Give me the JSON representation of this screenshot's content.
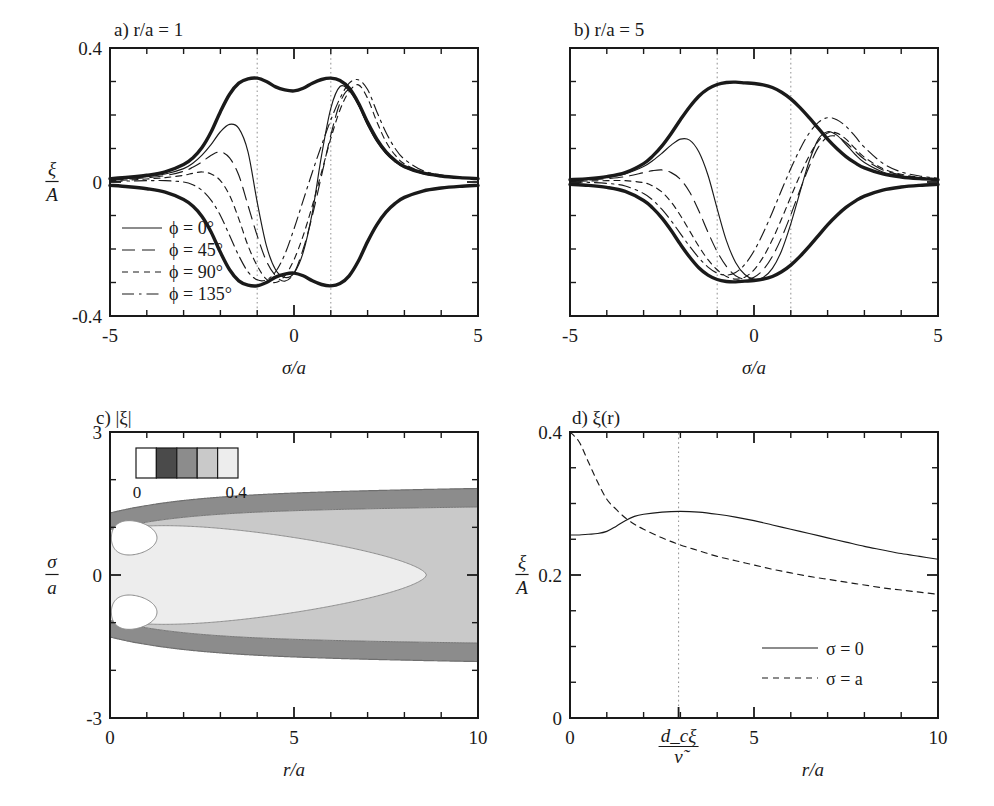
{
  "figure": {
    "background": "#ffffff",
    "ink": "#1a1a1a",
    "guide_color": "#9a9a9a"
  },
  "panels": {
    "a": {
      "title": "a) r/a = 1",
      "letter": "a)",
      "condition": "r/a = 1",
      "xlabel": "σ/a",
      "ylabel_num": "ξ",
      "ylabel_den": "A",
      "xticks": [
        "-5",
        "0",
        "5"
      ],
      "yticks": [
        "0.4",
        "0",
        "-0.4"
      ],
      "xlim": [
        -5,
        5
      ],
      "ylim": [
        -0.4,
        0.4
      ],
      "guides": [
        "-1",
        "1"
      ],
      "legend": [
        {
          "label": "ϕ = 0°",
          "style": "solid"
        },
        {
          "label": "ϕ = 45°",
          "style": "longdash"
        },
        {
          "label": "ϕ = 90°",
          "style": "shortdash"
        },
        {
          "label": "ϕ = 135°",
          "style": "dashdot"
        }
      ]
    },
    "b": {
      "title": "b) r/a = 5",
      "letter": "b)",
      "condition": "r/a = 5",
      "xlabel": "σ/a",
      "xticks": [
        "-5",
        "0",
        "5"
      ],
      "yticks": [
        "",
        "",
        ""
      ],
      "xlim": [
        -5,
        5
      ],
      "ylim": [
        -0.4,
        0.4
      ],
      "guides": [
        "-1",
        "1"
      ]
    },
    "c": {
      "title": "c) |ξ|",
      "letter": "c)",
      "quantity": "|ξ|",
      "xlabel": "r/a",
      "ylabel_num": "σ",
      "ylabel_den": "a",
      "xticks": [
        "0",
        "5",
        "10"
      ],
      "yticks": [
        "3",
        "0",
        "-3"
      ],
      "xlim": [
        0,
        10
      ],
      "ylim": [
        -3,
        3
      ],
      "colorbar": {
        "min_label": "0",
        "max_label": "0.4",
        "swatches": [
          "#ffffff",
          "#4a4a4a",
          "#8c8c8c",
          "#c9c9c9",
          "#ededed"
        ]
      }
    },
    "d": {
      "title": "d) ξ(r)",
      "letter": "d)",
      "quantity": "ξ(r)",
      "xlabel": "r/a",
      "ylabel_num": "ξ",
      "ylabel_den": "A",
      "xticks": [
        "0",
        "5",
        "10"
      ],
      "yticks": [
        "0.4",
        "0.2",
        "0"
      ],
      "xlim": [
        0,
        10
      ],
      "ylim": [
        0,
        0.4
      ],
      "special_tick": {
        "num": "d_cξ",
        "den": "ν̃",
        "x": 2.95
      },
      "legend": [
        {
          "label": "σ = 0",
          "style": "solid"
        },
        {
          "label": "σ = a",
          "style": "shortdash"
        }
      ]
    }
  },
  "chart_data": [
    {
      "id": "panel-a",
      "type": "line",
      "title": "a) r/a = 1",
      "xlabel": "sigma/a",
      "ylabel": "xi/A",
      "xlim": [
        -5,
        5
      ],
      "ylim": [
        -0.4,
        0.4
      ],
      "grid": false,
      "vertical_guides": [
        -1,
        1
      ],
      "legend_position": "lower-left",
      "x": [
        -5,
        -4.5,
        -4,
        -3.5,
        -3,
        -2.75,
        -2.5,
        -2.25,
        -2,
        -1.75,
        -1.5,
        -1.25,
        -1,
        -0.75,
        -0.5,
        -0.25,
        0,
        0.25,
        0.5,
        0.75,
        1,
        1.25,
        1.5,
        1.75,
        2,
        2.25,
        2.5,
        2.75,
        3,
        3.5,
        4,
        4.5,
        5
      ],
      "series": [
        {
          "name": "envelope upper",
          "style": "thick-solid",
          "values": [
            0.01,
            0.014,
            0.02,
            0.03,
            0.052,
            0.072,
            0.103,
            0.15,
            0.21,
            0.262,
            0.295,
            0.308,
            0.31,
            0.3,
            0.284,
            0.275,
            0.272,
            0.28,
            0.295,
            0.306,
            0.31,
            0.303,
            0.28,
            0.236,
            0.178,
            0.128,
            0.09,
            0.064,
            0.046,
            0.027,
            0.018,
            0.013,
            0.01
          ]
        },
        {
          "name": "envelope lower",
          "style": "thick-solid",
          "values": [
            -0.01,
            -0.014,
            -0.02,
            -0.03,
            -0.052,
            -0.072,
            -0.103,
            -0.15,
            -0.21,
            -0.262,
            -0.295,
            -0.308,
            -0.31,
            -0.3,
            -0.284,
            -0.275,
            -0.272,
            -0.28,
            -0.295,
            -0.306,
            -0.31,
            -0.303,
            -0.28,
            -0.236,
            -0.178,
            -0.128,
            -0.09,
            -0.064,
            -0.046,
            -0.027,
            -0.018,
            -0.013,
            -0.01
          ]
        },
        {
          "name": "phi = 0 deg",
          "style": "solid",
          "values": [
            0.008,
            0.011,
            0.016,
            0.024,
            0.04,
            0.056,
            0.08,
            0.112,
            0.15,
            0.172,
            0.16,
            0.09,
            -0.06,
            -0.19,
            -0.262,
            -0.285,
            -0.272,
            -0.21,
            -0.09,
            0.08,
            0.22,
            0.285,
            0.272,
            0.23,
            0.17,
            0.12,
            0.085,
            0.06,
            0.043,
            0.025,
            0.017,
            0.012,
            0.009
          ]
        },
        {
          "name": "phi = 45 deg",
          "style": "longdash",
          "values": [
            0.006,
            0.009,
            0.013,
            0.019,
            0.032,
            0.044,
            0.06,
            0.08,
            0.09,
            0.072,
            0.02,
            -0.07,
            -0.16,
            -0.236,
            -0.28,
            -0.296,
            -0.272,
            -0.2,
            -0.1,
            0.02,
            0.14,
            0.236,
            0.275,
            0.23,
            0.172,
            0.124,
            0.088,
            0.062,
            0.045,
            0.026,
            0.017,
            0.012,
            0.009
          ]
        },
        {
          "name": "phi = 90 deg",
          "style": "shortdash",
          "values": [
            0.004,
            0.006,
            0.009,
            0.013,
            0.02,
            0.026,
            0.03,
            0.024,
            0.004,
            -0.04,
            -0.11,
            -0.19,
            -0.25,
            -0.29,
            -0.3,
            -0.28,
            -0.232,
            -0.16,
            -0.07,
            0.03,
            0.13,
            0.215,
            0.27,
            0.29,
            0.25,
            0.18,
            0.12,
            0.08,
            0.054,
            0.03,
            0.019,
            0.013,
            0.01
          ]
        },
        {
          "name": "phi = 135 deg",
          "style": "dashdot",
          "values": [
            0.002,
            0.003,
            0.004,
            0.004,
            0.0,
            -0.008,
            -0.025,
            -0.055,
            -0.1,
            -0.16,
            -0.22,
            -0.268,
            -0.292,
            -0.292,
            -0.268,
            -0.216,
            -0.14,
            -0.055,
            0.03,
            0.11,
            0.185,
            0.25,
            0.295,
            0.305,
            0.276,
            0.21,
            0.148,
            0.1,
            0.068,
            0.034,
            0.021,
            0.014,
            0.01
          ]
        }
      ]
    },
    {
      "id": "panel-b",
      "type": "line",
      "title": "b) r/a = 5",
      "xlabel": "sigma/a",
      "ylabel": "xi/A",
      "xlim": [
        -5,
        5
      ],
      "ylim": [
        -0.4,
        0.4
      ],
      "grid": false,
      "vertical_guides": [
        -1,
        1
      ],
      "x": [
        -5,
        -4.5,
        -4,
        -3.5,
        -3,
        -2.75,
        -2.5,
        -2.25,
        -2,
        -1.75,
        -1.5,
        -1.25,
        -1,
        -0.75,
        -0.5,
        -0.25,
        0,
        0.25,
        0.5,
        0.75,
        1,
        1.25,
        1.5,
        1.75,
        2,
        2.25,
        2.5,
        2.75,
        3,
        3.5,
        4,
        4.5,
        5
      ],
      "series": [
        {
          "name": "envelope upper",
          "style": "thick-solid",
          "values": [
            0.007,
            0.01,
            0.016,
            0.028,
            0.055,
            0.078,
            0.108,
            0.145,
            0.186,
            0.224,
            0.256,
            0.278,
            0.291,
            0.297,
            0.298,
            0.296,
            0.294,
            0.29,
            0.282,
            0.268,
            0.248,
            0.222,
            0.192,
            0.16,
            0.128,
            0.1,
            0.076,
            0.057,
            0.042,
            0.024,
            0.015,
            0.01,
            0.007
          ]
        },
        {
          "name": "envelope lower",
          "style": "thick-solid",
          "values": [
            -0.007,
            -0.01,
            -0.016,
            -0.028,
            -0.055,
            -0.078,
            -0.108,
            -0.145,
            -0.186,
            -0.224,
            -0.256,
            -0.278,
            -0.291,
            -0.297,
            -0.298,
            -0.296,
            -0.294,
            -0.29,
            -0.282,
            -0.268,
            -0.248,
            -0.222,
            -0.192,
            -0.16,
            -0.128,
            -0.1,
            -0.076,
            -0.057,
            -0.042,
            -0.024,
            -0.015,
            -0.01,
            -0.007
          ]
        },
        {
          "name": "phi = 0 deg",
          "style": "solid",
          "values": [
            0.006,
            0.009,
            0.014,
            0.024,
            0.046,
            0.064,
            0.086,
            0.11,
            0.128,
            0.125,
            0.09,
            0.02,
            -0.08,
            -0.175,
            -0.24,
            -0.276,
            -0.29,
            -0.285,
            -0.258,
            -0.205,
            -0.125,
            -0.03,
            0.062,
            0.128,
            0.15,
            0.14,
            0.112,
            0.082,
            0.058,
            0.03,
            0.018,
            0.011,
            0.007
          ]
        },
        {
          "name": "phi = 45 deg",
          "style": "longdash",
          "values": [
            0.004,
            0.006,
            0.01,
            0.016,
            0.028,
            0.034,
            0.036,
            0.028,
            0.008,
            -0.03,
            -0.086,
            -0.15,
            -0.208,
            -0.252,
            -0.28,
            -0.29,
            -0.284,
            -0.262,
            -0.222,
            -0.166,
            -0.098,
            -0.024,
            0.046,
            0.104,
            0.134,
            0.136,
            0.118,
            0.092,
            0.068,
            0.036,
            0.021,
            0.013,
            0.008
          ]
        },
        {
          "name": "phi = 90 deg",
          "style": "shortdash",
          "values": [
            0.002,
            0.003,
            0.004,
            0.004,
            -0.002,
            -0.012,
            -0.03,
            -0.06,
            -0.1,
            -0.146,
            -0.192,
            -0.232,
            -0.262,
            -0.282,
            -0.29,
            -0.284,
            -0.262,
            -0.224,
            -0.172,
            -0.11,
            -0.044,
            0.02,
            0.078,
            0.122,
            0.146,
            0.146,
            0.128,
            0.1,
            0.074,
            0.04,
            0.023,
            0.014,
            0.009
          ]
        },
        {
          "name": "phi = 135 deg",
          "style": "dashdot",
          "values": [
            0.0,
            -0.001,
            -0.004,
            -0.012,
            -0.034,
            -0.054,
            -0.082,
            -0.116,
            -0.154,
            -0.192,
            -0.226,
            -0.254,
            -0.272,
            -0.278,
            -0.27,
            -0.246,
            -0.206,
            -0.152,
            -0.09,
            -0.024,
            0.04,
            0.098,
            0.146,
            0.178,
            0.192,
            0.186,
            0.166,
            0.136,
            0.104,
            0.056,
            0.03,
            0.018,
            0.011
          ]
        }
      ]
    },
    {
      "id": "panel-c",
      "type": "heatmap",
      "title": "c) |xi|",
      "xlabel": "r/a",
      "ylabel": "sigma/a",
      "xlim": [
        0,
        10
      ],
      "ylim": [
        -3,
        3
      ],
      "grid": false,
      "colorbar_range": [
        0,
        0.4
      ],
      "colorbar_levels": [
        0.0,
        0.08,
        0.16,
        0.24,
        0.32,
        0.4
      ],
      "colorbar_colors": [
        "#ffffff",
        "#4a4a4a",
        "#8c8c8c",
        "#c9c9c9",
        "#ededed"
      ],
      "description": "Contours of |xi| in the (r/a, sigma/a) plane; wedge-shaped light region opening from r/a=0 toward large r with two small white eyes near r/a<1, bounded above and below by medium and dark grey bands that persist to r/a=10."
    },
    {
      "id": "panel-d",
      "type": "line",
      "title": "d) xi(r)",
      "xlabel": "r/a",
      "ylabel": "xi/A",
      "xlim": [
        0,
        10
      ],
      "ylim": [
        0,
        0.4
      ],
      "grid": false,
      "vertical_guides": [
        2.95
      ],
      "legend_position": "lower-right",
      "x": [
        0,
        0.25,
        0.5,
        0.75,
        1,
        1.25,
        1.5,
        1.75,
        2,
        2.5,
        3,
        3.5,
        4,
        4.5,
        5,
        5.5,
        6,
        6.5,
        7,
        7.5,
        8,
        8.5,
        9,
        9.5,
        10
      ],
      "series": [
        {
          "name": "sigma = 0",
          "style": "solid",
          "values": [
            0.256,
            0.256,
            0.257,
            0.258,
            0.261,
            0.268,
            0.276,
            0.282,
            0.285,
            0.288,
            0.289,
            0.288,
            0.285,
            0.281,
            0.276,
            0.27,
            0.264,
            0.258,
            0.252,
            0.246,
            0.24,
            0.235,
            0.23,
            0.226,
            0.222
          ]
        },
        {
          "name": "sigma = a",
          "style": "shortdash",
          "values": [
            0.4,
            0.386,
            0.358,
            0.33,
            0.306,
            0.292,
            0.28,
            0.271,
            0.264,
            0.252,
            0.242,
            0.234,
            0.226,
            0.22,
            0.214,
            0.208,
            0.203,
            0.198,
            0.194,
            0.19,
            0.186,
            0.182,
            0.179,
            0.176,
            0.173
          ]
        }
      ]
    }
  ]
}
